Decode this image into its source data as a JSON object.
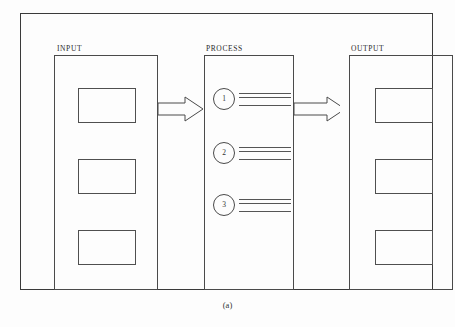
{
  "figure": {
    "caption": "(a)",
    "stages": [
      {
        "id": "input",
        "label": "INPUT",
        "kind": "slots",
        "slots": [
          {
            "label": ""
          },
          {
            "label": ""
          },
          {
            "label": ""
          }
        ]
      },
      {
        "id": "process",
        "label": "PROCESS",
        "kind": "steps",
        "steps": [
          {
            "number": "1",
            "rules": 3
          },
          {
            "number": "2",
            "rules": 3
          },
          {
            "number": "3",
            "rules": 3
          }
        ]
      },
      {
        "id": "output",
        "label": "OUTPUT",
        "kind": "slots",
        "slots": [
          {
            "label": ""
          },
          {
            "label": ""
          },
          {
            "label": ""
          }
        ]
      }
    ],
    "connectors": [
      {
        "id": "input-to-process",
        "from": "input",
        "to": "process",
        "style": "hollow-block-arrow",
        "direction": "right"
      },
      {
        "id": "process-to-output",
        "from": "process",
        "to": "output",
        "style": "hollow-block-arrow",
        "direction": "right"
      }
    ],
    "colors": {
      "line": "#4a4a4a",
      "frame": "#3a3a3a",
      "text": "#2b2b2b",
      "background": "#fdfdfd"
    }
  }
}
